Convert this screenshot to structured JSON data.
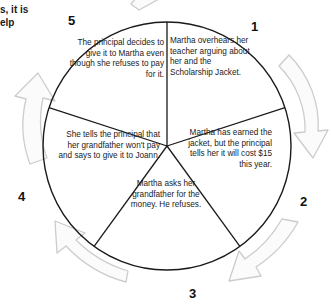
{
  "page": {
    "type": "cycle-diagram",
    "cut_off_text": "s, it is\nelp",
    "colors": {
      "circle_stroke": "#1a1a1a",
      "divider_stroke": "#1a1a1a",
      "arrow_stroke": "#c9c9c9",
      "arrow_fill": "#fafafa",
      "text": "#1b1b1b",
      "number": "#111111",
      "background": "#ffffff"
    }
  },
  "diagram": {
    "center": {
      "x": 167,
      "y": 146
    },
    "radius": 124,
    "segment_count": 5,
    "segments": [
      {
        "number": "1",
        "position": "upper-right",
        "text": "Martha overhears her teacher arguing about her and the Scholarship Jacket."
      },
      {
        "number": "2",
        "position": "right",
        "text": "Martha has earned the jacket, but the principal tells her it will cost $15 this year."
      },
      {
        "number": "3",
        "position": "bottom",
        "text": "Martha asks her grandfather for the money. He refuses."
      },
      {
        "number": "4",
        "position": "left",
        "text": "She tells the principal that her grandfather won't pay and says to give it to Joann."
      },
      {
        "number": "5",
        "position": "upper-left",
        "text": "The principal decides to give it to Martha even though she refuses to pay for it."
      }
    ],
    "arrows": [
      {
        "name": "arrow-top",
        "direction": "clockwise"
      },
      {
        "name": "arrow-right",
        "direction": "clockwise"
      },
      {
        "name": "arrow-bottom-right",
        "direction": "clockwise"
      },
      {
        "name": "arrow-bottom-left",
        "direction": "clockwise"
      },
      {
        "name": "arrow-left",
        "direction": "clockwise"
      }
    ]
  }
}
